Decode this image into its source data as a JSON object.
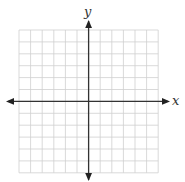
{
  "diagram": {
    "type": "coordinate-plane",
    "grid": {
      "columns": 12,
      "rows": 12,
      "left": 19,
      "top": 30,
      "cell_width": 11.6,
      "cell_height": 11.9,
      "line_color": "#cfcfcf"
    },
    "axes": {
      "color": "#333333",
      "x_label": "x",
      "y_label": "y",
      "origin_px": [
        88.6,
        101.4
      ],
      "x_extent_px": [
        8,
        168
      ],
      "y_extent_px": [
        21,
        180
      ]
    }
  }
}
